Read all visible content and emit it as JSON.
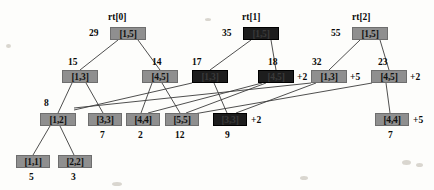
{
  "figure": {
    "kind": "persistent-segment-tree",
    "background": "#fdfdfb",
    "node_fill_gray": "#8f8f8f",
    "node_fill_dark": "#1d1d1d",
    "edge_color": "#3b3b3b"
  },
  "roots": [
    {
      "id": "rt0",
      "label": "rt[0]",
      "x": 108,
      "y": 12
    },
    {
      "id": "rt1",
      "label": "rt[1]",
      "x": 242,
      "y": 12
    },
    {
      "id": "rt2",
      "label": "rt[2]",
      "x": 352,
      "y": 12
    }
  ],
  "nodes": [
    {
      "id": "n_r0",
      "range": "[1,5]",
      "sum": "29",
      "tone": "gray",
      "x": 110,
      "y": 27,
      "w": 36,
      "sum_x": 89,
      "sum_y": 28
    },
    {
      "id": "n_r1",
      "range": "[1,5]",
      "sum": "35",
      "tone": "dark",
      "x": 243,
      "y": 27,
      "w": 36,
      "sum_x": 222,
      "sum_y": 28
    },
    {
      "id": "n_r2",
      "range": "[1,5]",
      "sum": "55",
      "tone": "gray",
      "x": 352,
      "y": 27,
      "w": 36,
      "sum_x": 331,
      "sum_y": 28
    },
    {
      "id": "n_a13",
      "range": "[1,3]",
      "sum": "15",
      "tone": "gray",
      "x": 62,
      "y": 70,
      "w": 36,
      "sum_x": 68,
      "sum_y": 57
    },
    {
      "id": "n_a45",
      "range": "[4,5]",
      "sum": "14",
      "tone": "gray",
      "x": 142,
      "y": 70,
      "w": 36,
      "sum_x": 152,
      "sum_y": 57
    },
    {
      "id": "n_b13",
      "range": "[1,3]",
      "sum": "17",
      "tone": "dark",
      "x": 192,
      "y": 70,
      "w": 36,
      "sum_x": 192,
      "sum_y": 57
    },
    {
      "id": "n_b45",
      "range": "[4,5]",
      "sum": "18",
      "tone": "dark",
      "x": 258,
      "y": 70,
      "w": 36,
      "sum_x": 268,
      "sum_y": 57,
      "plus": "+2",
      "plus_x": 297,
      "plus_y": 72
    },
    {
      "id": "n_c13",
      "range": "[1,3]",
      "sum": "32",
      "tone": "gray",
      "x": 311,
      "y": 70,
      "w": 36,
      "sum_x": 312,
      "sum_y": 57,
      "plus": "+5",
      "plus_x": 350,
      "plus_y": 72
    },
    {
      "id": "n_c45",
      "range": "[4,5]",
      "sum": "23",
      "tone": "gray",
      "x": 371,
      "y": 70,
      "w": 36,
      "sum_x": 378,
      "sum_y": 57,
      "plus": "+2",
      "plus_x": 410,
      "plus_y": 72
    },
    {
      "id": "n_12",
      "range": "[1,2]",
      "sum": "8",
      "tone": "gray",
      "x": 40,
      "y": 113,
      "w": 36,
      "sum_x": 44,
      "sum_y": 98
    },
    {
      "id": "n_33a",
      "range": "[3,3]",
      "sum": "7",
      "tone": "gray",
      "x": 88,
      "y": 113,
      "w": 34,
      "sum_x": 100,
      "sum_y": 130
    },
    {
      "id": "n_44a",
      "range": "[4,4]",
      "sum": "2",
      "tone": "gray",
      "x": 126,
      "y": 113,
      "w": 34,
      "sum_x": 138,
      "sum_y": 130
    },
    {
      "id": "n_55",
      "range": "[5,5]",
      "sum": "12",
      "tone": "gray",
      "x": 165,
      "y": 113,
      "w": 34,
      "sum_x": 175,
      "sum_y": 130
    },
    {
      "id": "n_33b",
      "range": "[3,3]",
      "sum": "9",
      "tone": "dark",
      "x": 213,
      "y": 113,
      "w": 34,
      "sum_x": 225,
      "sum_y": 130,
      "plus": "+2",
      "plus_x": 251,
      "plus_y": 115
    },
    {
      "id": "n_44b",
      "range": "[4,4]",
      "sum": "7",
      "tone": "gray",
      "x": 375,
      "y": 113,
      "w": 34,
      "sum_x": 388,
      "sum_y": 130,
      "plus": "+5",
      "plus_x": 413,
      "plus_y": 115
    },
    {
      "id": "n_11",
      "range": "[1,1]",
      "sum": "5",
      "tone": "gray",
      "x": 16,
      "y": 155,
      "w": 34,
      "sum_x": 29,
      "sum_y": 172
    },
    {
      "id": "n_22",
      "range": "[2,2]",
      "sum": "3",
      "tone": "gray",
      "x": 58,
      "y": 155,
      "w": 34,
      "sum_x": 71,
      "sum_y": 172
    }
  ],
  "edges": [
    {
      "from": "n_r0",
      "to": "n_a13",
      "x1": 118,
      "y1": 40,
      "x2": 80,
      "y2": 70
    },
    {
      "from": "n_r0",
      "to": "n_a45",
      "x1": 138,
      "y1": 40,
      "x2": 160,
      "y2": 70
    },
    {
      "from": "n_r1",
      "to": "n_b13",
      "x1": 251,
      "y1": 40,
      "x2": 210,
      "y2": 70
    },
    {
      "from": "n_r1",
      "to": "n_b45",
      "x1": 271,
      "y1": 40,
      "x2": 276,
      "y2": 70
    },
    {
      "from": "n_r2",
      "to": "n_c13",
      "x1": 360,
      "y1": 40,
      "x2": 329,
      "y2": 70
    },
    {
      "from": "n_r2",
      "to": "n_c45",
      "x1": 380,
      "y1": 40,
      "x2": 389,
      "y2": 70
    },
    {
      "from": "n_a13",
      "to": "n_12",
      "x1": 72,
      "y1": 83,
      "x2": 58,
      "y2": 113
    },
    {
      "from": "n_a13",
      "to": "n_33a",
      "x1": 86,
      "y1": 83,
      "x2": 103,
      "y2": 113
    },
    {
      "from": "n_a45",
      "to": "n_44a",
      "x1": 152,
      "y1": 83,
      "x2": 141,
      "y2": 113
    },
    {
      "from": "n_a45",
      "to": "n_55",
      "x1": 162,
      "y1": 83,
      "x2": 180,
      "y2": 113
    },
    {
      "from": "n_b13",
      "to": "n_12",
      "x1": 192,
      "y1": 83,
      "x2": 74,
      "y2": 110
    },
    {
      "from": "n_b13",
      "to": "n_33b",
      "x1": 214,
      "y1": 83,
      "x2": 227,
      "y2": 113
    },
    {
      "from": "n_b45",
      "to": "n_44a",
      "x1": 262,
      "y1": 83,
      "x2": 148,
      "y2": 113
    },
    {
      "from": "n_b45",
      "to": "n_55",
      "x1": 266,
      "y1": 83,
      "x2": 186,
      "y2": 113
    },
    {
      "from": "n_c13",
      "to": "n_12",
      "x1": 311,
      "y1": 83,
      "x2": 74,
      "y2": 108
    },
    {
      "from": "n_c13",
      "to": "n_33b",
      "x1": 316,
      "y1": 83,
      "x2": 236,
      "y2": 113
    },
    {
      "from": "n_c45",
      "to": "n_55",
      "x1": 372,
      "y1": 83,
      "x2": 188,
      "y2": 115
    },
    {
      "from": "n_c45",
      "to": "n_44b",
      "x1": 386,
      "y1": 83,
      "x2": 390,
      "y2": 113
    },
    {
      "from": "n_12",
      "to": "n_11",
      "x1": 50,
      "y1": 126,
      "x2": 33,
      "y2": 155
    },
    {
      "from": "n_12",
      "to": "n_22",
      "x1": 60,
      "y1": 126,
      "x2": 74,
      "y2": 155
    }
  ],
  "specks": [
    {
      "x": 402,
      "y": 160,
      "w": 9,
      "h": 5
    },
    {
      "x": 416,
      "y": 163,
      "w": 7,
      "h": 4
    },
    {
      "x": 300,
      "y": 176,
      "w": 8,
      "h": 4
    },
    {
      "x": 112,
      "y": 182,
      "w": 10,
      "h": 4
    },
    {
      "x": 6,
      "y": 44,
      "w": 5,
      "h": 4
    },
    {
      "x": 205,
      "y": 18,
      "w": 6,
      "h": 3
    }
  ]
}
